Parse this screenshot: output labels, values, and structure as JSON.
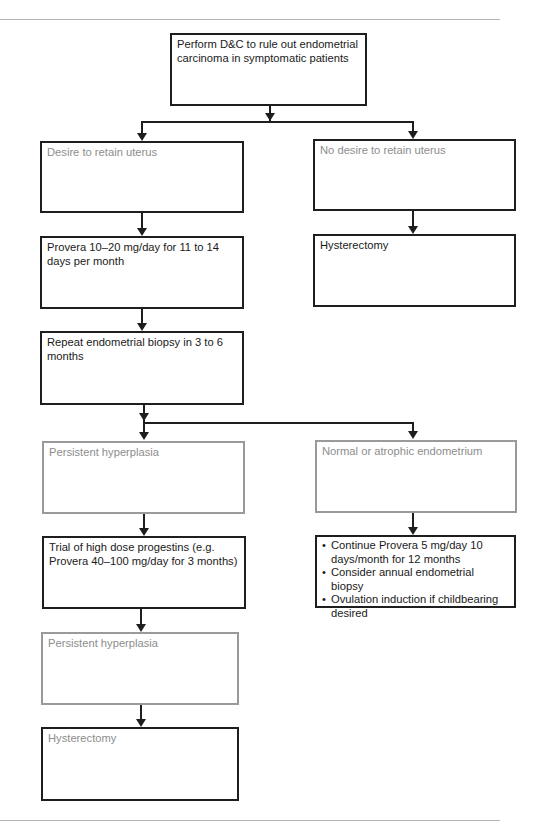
{
  "figure": {
    "type": "flowchart",
    "colors": {
      "border_dark": "#1e1e1e",
      "border_grey": "#9a9a9a",
      "text_dark": "#1a1a1a",
      "text_muted": "#8d8d8d",
      "rule": "#b5b5b5"
    }
  },
  "nodes": {
    "start": {
      "label": "Perform D&C to rule out endometrial carcinoma in symptomatic patients"
    },
    "retain": {
      "label": "Desire to retain uterus"
    },
    "no_retain": {
      "label": "No desire to retain uterus"
    },
    "provera": {
      "label": "Provera 10–20 mg/day for 11 to 14 days per month"
    },
    "hysterectomy_right": {
      "label": "Hysterectomy"
    },
    "repeat_biopsy": {
      "label": "Repeat endometrial biopsy in 3 to 6 months"
    },
    "persistent_1": {
      "label": "Persistent hyperplasia"
    },
    "normal_atrophic": {
      "label": "Normal or atrophic endometrium"
    },
    "high_dose": {
      "label": "Trial of high dose progestins (e.g. Provera 40–100 mg/day for 3 months)"
    },
    "followup": {
      "items": [
        "Continue Provera 5 mg/day 10 days/month for 12 months",
        "Consider annual endometrial biopsy",
        "Ovulation induction if childbearing desired"
      ]
    },
    "persistent_2": {
      "label": "Persistent hyperplasia"
    },
    "hysterectomy_bottom": {
      "label": "Hysterectomy"
    }
  },
  "edges": [
    {
      "from": "start",
      "to": "retain"
    },
    {
      "from": "start",
      "to": "no_retain"
    },
    {
      "from": "retain",
      "to": "provera"
    },
    {
      "from": "no_retain",
      "to": "hysterectomy_right"
    },
    {
      "from": "provera",
      "to": "repeat_biopsy"
    },
    {
      "from": "repeat_biopsy",
      "to": "persistent_1"
    },
    {
      "from": "repeat_biopsy",
      "to": "normal_atrophic"
    },
    {
      "from": "persistent_1",
      "to": "high_dose"
    },
    {
      "from": "normal_atrophic",
      "to": "followup"
    },
    {
      "from": "high_dose",
      "to": "persistent_2"
    },
    {
      "from": "persistent_2",
      "to": "hysterectomy_bottom"
    }
  ]
}
